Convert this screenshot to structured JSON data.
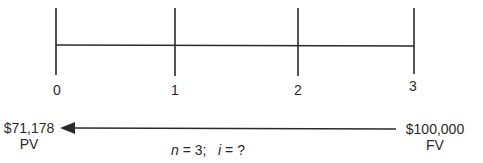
{
  "timeline": {
    "periods": [
      "0",
      "1",
      "2",
      "3"
    ]
  },
  "present_value": {
    "amount": "$71,178",
    "label": "PV"
  },
  "future_value": {
    "amount": "$100,000",
    "label": "FV"
  },
  "equation": {
    "n_var": "n",
    "n_value": " = 3;",
    "i_var": "i",
    "i_value": " = ?"
  },
  "colors": {
    "line": "#2a2a2a",
    "background": "#ffffff"
  }
}
